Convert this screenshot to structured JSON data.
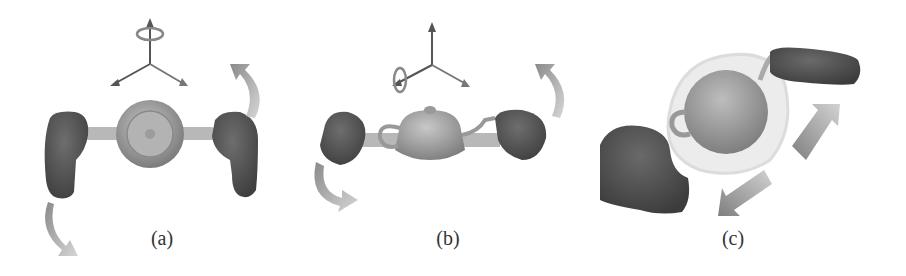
{
  "figure": {
    "panels": [
      {
        "id": "a",
        "label": "(a)",
        "description": "Top view: two fists holding a bar with teapot; rotation about vertical axis"
      },
      {
        "id": "b",
        "label": "(b)",
        "description": "Side view: two fists holding a bar with teapot; rotation about horizontal axis"
      },
      {
        "id": "c",
        "label": "(c)",
        "description": "Perspective view: hands translating teapot, arrows indicate diagonal motion"
      }
    ],
    "colors": {
      "hand": "#555555",
      "bar": "#b5b5b5",
      "teapot": "#9a9a9a",
      "arrow": "#a8a8a8",
      "axis": "#6a6a6a",
      "ghost": "#e6e6e6"
    }
  }
}
